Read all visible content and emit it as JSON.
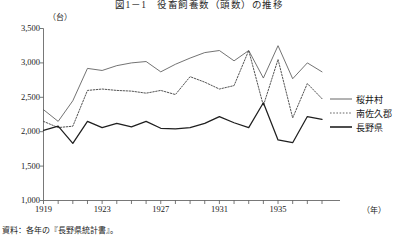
{
  "figure": {
    "title": "図1－1　役畜飼養数（頭数）の推移",
    "y_unit": "（台）",
    "x_unit": "（年）",
    "source": "資料：各年の『長野県統計書』。"
  },
  "legend": {
    "position": "right",
    "items": [
      {
        "label": "桜井村",
        "style": "solid-thin",
        "color": "#555555"
      },
      {
        "label": "南佐久郡",
        "style": "dotted",
        "color": "#555555"
      },
      {
        "label": "長野県",
        "style": "solid-thick",
        "color": "#222222"
      }
    ]
  },
  "axes": {
    "y_ticks": [
      "1,000",
      "1,500",
      "2,000",
      "2,500",
      "3,000",
      "3,500"
    ],
    "y_tick_values": [
      1000,
      1500,
      2000,
      2500,
      3000,
      3500
    ],
    "ylim": [
      1000,
      3500
    ],
    "x_ticks": [
      "1919",
      "1923",
      "1927",
      "1931",
      "1935"
    ],
    "x_tick_values": [
      1919,
      1923,
      1927,
      1931,
      1935
    ],
    "xlim": [
      1919,
      1938
    ]
  },
  "chart_data": {
    "type": "line",
    "title": "図1－1　役畜飼養数（頭数）の推移",
    "xlabel": "（年）",
    "ylabel": "（台）",
    "ylim": [
      1000,
      3500
    ],
    "xlim": [
      1919,
      1938
    ],
    "grid": false,
    "legend_position": "right",
    "x": [
      1919,
      1920,
      1921,
      1922,
      1923,
      1924,
      1925,
      1926,
      1927,
      1928,
      1929,
      1930,
      1931,
      1932,
      1933,
      1934,
      1935,
      1936,
      1937,
      1938
    ],
    "series": [
      {
        "name": "桜井村",
        "style": "solid-thin",
        "values": [
          2320,
          2150,
          2450,
          2920,
          2890,
          2960,
          3000,
          3020,
          2870,
          2980,
          3070,
          3150,
          3180,
          3030,
          3180,
          2780,
          3250,
          2770,
          3000,
          2870
        ]
      },
      {
        "name": "南佐久郡",
        "style": "dotted",
        "values": [
          2150,
          2060,
          2080,
          2600,
          2620,
          2600,
          2590,
          2560,
          2600,
          2540,
          2800,
          2720,
          2620,
          2670,
          3180,
          2380,
          3050,
          2200,
          2700,
          2480
        ]
      },
      {
        "name": "長野県",
        "style": "solid-thick",
        "values": [
          2020,
          2080,
          1830,
          2150,
          2060,
          2120,
          2070,
          2150,
          2050,
          2040,
          2060,
          2120,
          2220,
          2130,
          2060,
          2420,
          1880,
          1840,
          2220,
          2180
        ]
      }
    ]
  }
}
